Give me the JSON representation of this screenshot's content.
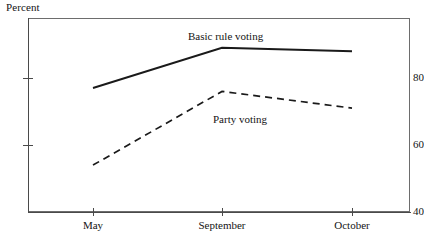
{
  "chart_data": {
    "type": "line",
    "title": "",
    "ylabel": "Percent",
    "xlabel": "",
    "categories": [
      "May",
      "September",
      "October"
    ],
    "ylim": [
      40,
      96
    ],
    "yticks": [
      40,
      60,
      80
    ],
    "ytick_labels": [
      "40",
      "60",
      "80"
    ],
    "grid": false,
    "legend_position": "inline-annotation",
    "series": [
      {
        "name": "Basic rule voting",
        "style": "solid",
        "color": "#1a1a1a",
        "values": [
          77,
          89,
          88
        ]
      },
      {
        "name": "Party voting",
        "style": "dashed",
        "color": "#1a1a1a",
        "values": [
          54,
          76,
          71
        ]
      }
    ],
    "annotations": [
      {
        "text": "Basic rule voting",
        "x": 188,
        "y": 30
      },
      {
        "text": "Party voting",
        "x": 213,
        "y": 113
      }
    ]
  },
  "axis": {
    "y_title": "Percent",
    "y_labels": [
      "80",
      "60",
      "40"
    ],
    "x_labels": [
      "May",
      "September",
      "October"
    ]
  },
  "series_labels": {
    "basic_rule_voting": "Basic rule voting",
    "party_voting": "Party voting"
  }
}
